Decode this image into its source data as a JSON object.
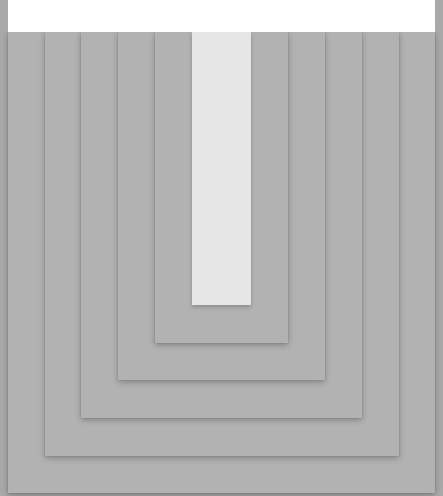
{
  "colors": {
    "background": "#a9a9a9",
    "card": "#b2b2b2",
    "innermost": "#e6e6e6",
    "top_panel": "#ffffff"
  },
  "layers": [
    {
      "name": "card-level-1",
      "left": 8,
      "right": 435,
      "bottom": 493
    },
    {
      "name": "card-level-2",
      "left": 45,
      "right": 399,
      "bottom": 456
    },
    {
      "name": "card-level-3",
      "left": 81,
      "right": 362,
      "bottom": 418
    },
    {
      "name": "card-level-4",
      "left": 118,
      "right": 325,
      "bottom": 380
    },
    {
      "name": "card-level-5",
      "left": 155,
      "right": 288,
      "bottom": 343
    },
    {
      "name": "card-innermost",
      "left": 192,
      "right": 251,
      "bottom": 305
    }
  ]
}
